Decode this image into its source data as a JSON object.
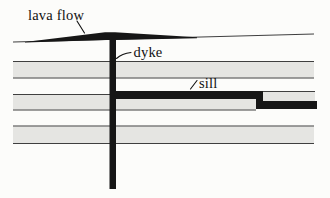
{
  "diagram": {
    "labels": {
      "lava_flow": "lava flow",
      "dyke": "dyke",
      "sill": "sill"
    },
    "colors": {
      "background": "#fcfcfa",
      "rock_layer_gray": "#e5e5e2",
      "bedding_line": "#3f3f3f",
      "igneous_black": "#161616",
      "label_text": "#111111"
    }
  }
}
